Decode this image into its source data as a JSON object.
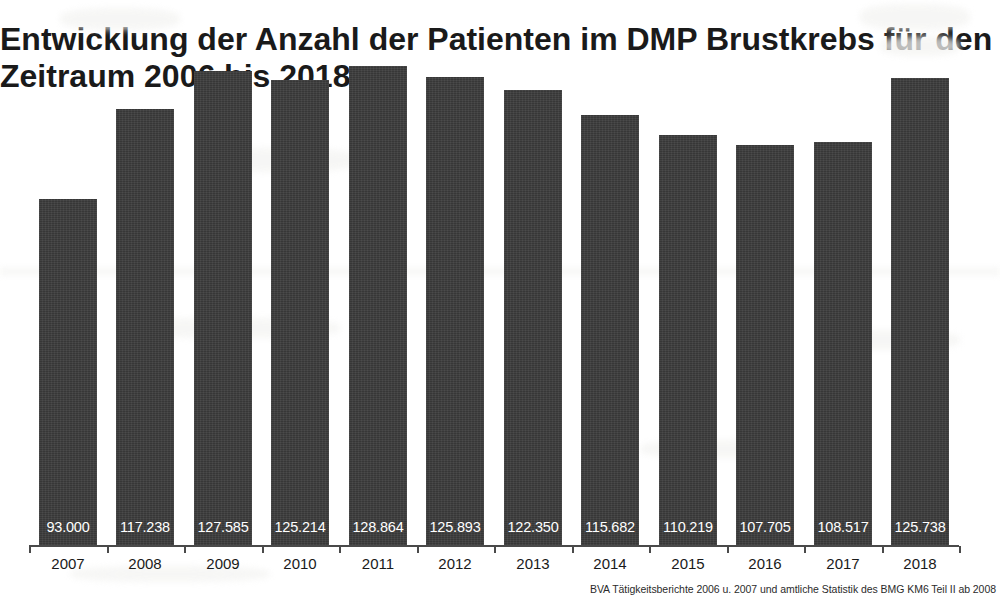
{
  "chart_data": {
    "type": "bar",
    "title": "Entwicklung der Anzahl der Patienten im DMP Brustkrebs für den Zeitraum 2006 bis 2018",
    "title_line1": "Entwicklung der Anzahl der Patienten im DMP Brustkrebs",
    "title_line2": "für den Zeitraum 2006 bis 2018",
    "xlabel": "",
    "ylabel": "",
    "categories": [
      "2007",
      "2008",
      "2009",
      "2010",
      "2011",
      "2012",
      "2013",
      "2014",
      "2015",
      "2016",
      "2017",
      "2018"
    ],
    "values": [
      93000,
      117238,
      127585,
      125214,
      128864,
      125893,
      122350,
      115682,
      110219,
      107705,
      108517,
      125738
    ],
    "value_labels": [
      "93.000",
      "117.238",
      "127.585",
      "125.214",
      "128.864",
      "125.893",
      "122.350",
      "115.682",
      "110.219",
      "107.705",
      "108.517",
      "125.738"
    ],
    "ylim": [
      0,
      137000
    ],
    "grid": false,
    "legend": null,
    "bar_color": "#3c3c3c",
    "value_label_color": "#ffffff",
    "background_color": "#ffffff",
    "axis_color": "#4a4a4a"
  },
  "source_note": "BVA Tätigkeitsberichte 2006 u. 2007 und amtliche Statistik des BMG KM6 Teil II ab 2008"
}
